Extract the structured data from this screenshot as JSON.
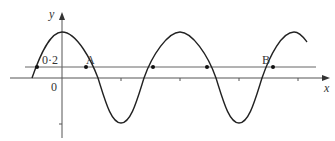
{
  "diagram": {
    "type": "sine-graph",
    "axes": {
      "x_label": "x",
      "y_label": "y",
      "origin_label": "0"
    },
    "horizontal_line": {
      "label": "0·2",
      "value": 0.2
    },
    "points": [
      {
        "label": ""
      },
      {
        "label": "A"
      },
      {
        "label": ""
      },
      {
        "label": ""
      },
      {
        "label": "B"
      }
    ],
    "colors": {
      "curve": "#222222",
      "axis": "#555555",
      "line": "#666666"
    }
  }
}
